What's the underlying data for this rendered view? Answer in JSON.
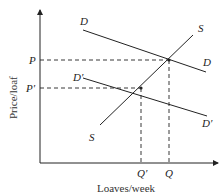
{
  "diagram": {
    "type": "supply-demand",
    "axes": {
      "xlabel": "Loaves/week",
      "ylabel": "Price/loaf"
    },
    "curves": {
      "supply": {
        "label_top": "S",
        "label_bottom": "S"
      },
      "demand": {
        "label_left": "D",
        "label_right": "D"
      },
      "demand_shifted": {
        "label_left": "D′",
        "label_right": "D′"
      }
    },
    "price_ticks": {
      "p": "P",
      "p_prime": "P′"
    },
    "quantity_ticks": {
      "q": "Q",
      "q_prime": "Q′"
    },
    "colors": {
      "line": "#222222",
      "background": "#ffffff"
    }
  }
}
